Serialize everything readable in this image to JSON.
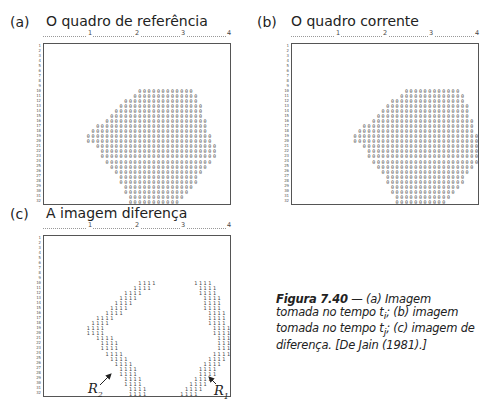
{
  "panels": [
    {
      "id": "a",
      "letter": "(a)",
      "title": "O quadro de referência",
      "ruler_ticks": [
        "1",
        "2",
        "3",
        "4"
      ],
      "row_numbers": [
        "1",
        "2",
        "3",
        "4",
        "5",
        "6",
        "7",
        "8",
        "9",
        "10",
        "11",
        "12",
        "13",
        "14",
        "15",
        "16",
        "17",
        "18",
        "19",
        "20",
        "21",
        "22",
        "23",
        "24",
        "25",
        "26",
        "27",
        "28",
        "29",
        "30",
        "31",
        "32"
      ],
      "glyph": "0",
      "rows": {
        "10": [
          20,
          31
        ],
        "11": [
          19,
          32
        ],
        "12": [
          17,
          32
        ],
        "13": [
          16,
          33
        ],
        "14": [
          15,
          33
        ],
        "15": [
          14,
          33
        ],
        "16": [
          13,
          34
        ],
        "17": [
          11,
          34
        ],
        "18": [
          10,
          34
        ],
        "19": [
          9,
          35
        ],
        "20": [
          9,
          35
        ],
        "21": [
          11,
          36
        ],
        "22": [
          12,
          36
        ],
        "23": [
          12,
          36
        ],
        "24": [
          13,
          35
        ],
        "25": [
          14,
          34
        ],
        "26": [
          15,
          33
        ],
        "27": [
          16,
          32
        ],
        "28": [
          16,
          32
        ],
        "29": [
          17,
          31
        ],
        "30": [
          17,
          30
        ],
        "31": [
          18,
          29
        ],
        "32": [
          18,
          28
        ]
      }
    },
    {
      "id": "b",
      "letter": "(b)",
      "title": "O quadro corrente",
      "ruler_ticks": [
        "1",
        "2",
        "3",
        "4"
      ],
      "row_numbers": [
        "1",
        "2",
        "3",
        "4",
        "5",
        "6",
        "7",
        "8",
        "9",
        "10",
        "11",
        "12",
        "13",
        "14",
        "15",
        "16",
        "17",
        "18",
        "19",
        "20",
        "21",
        "22",
        "23",
        "24",
        "25",
        "26",
        "27",
        "28",
        "29",
        "30",
        "31",
        "32"
      ],
      "glyph": "0",
      "rows": {
        "10": [
          24,
          35
        ],
        "11": [
          23,
          36
        ],
        "12": [
          21,
          36
        ],
        "13": [
          20,
          37
        ],
        "14": [
          19,
          37
        ],
        "15": [
          18,
          37
        ],
        "16": [
          17,
          38
        ],
        "17": [
          15,
          38
        ],
        "18": [
          14,
          38
        ],
        "19": [
          13,
          39
        ],
        "20": [
          13,
          39
        ],
        "21": [
          15,
          39
        ],
        "22": [
          16,
          39
        ],
        "23": [
          16,
          39
        ],
        "24": [
          17,
          39
        ],
        "25": [
          18,
          38
        ],
        "26": [
          19,
          37
        ],
        "27": [
          20,
          36
        ],
        "28": [
          20,
          36
        ],
        "29": [
          21,
          35
        ],
        "30": [
          21,
          34
        ],
        "31": [
          22,
          33
        ],
        "32": [
          22,
          32
        ]
      }
    },
    {
      "id": "c",
      "letter": "(c)",
      "title": "A imagem diferença",
      "ruler_ticks": [
        "1",
        "2",
        "3",
        "4"
      ],
      "row_numbers": [
        "1",
        "2",
        "3",
        "4",
        "5",
        "6",
        "7",
        "8",
        "9",
        "10",
        "11",
        "12",
        "13",
        "14",
        "15",
        "16",
        "17",
        "18",
        "19",
        "20",
        "21",
        "22",
        "23",
        "24",
        "25",
        "26",
        "27",
        "28",
        "29",
        "30",
        "31",
        "32"
      ],
      "glyph": "1",
      "region_labels": {
        "r2": {
          "base": "R",
          "sub": "2"
        },
        "r1": {
          "base": "R",
          "sub": "1"
        }
      }
    }
  ],
  "caption": {
    "label": "Figura 7.40",
    "dash": " — ",
    "text_a": "(a) Imagem tomada no tempo ",
    "ti": "t",
    "ti_sub": "i",
    "text_b": "; (b) imagem tomada no tempo ",
    "tj": "t",
    "tj_sub": "j",
    "text_c": "; (c) imagem de diferença. [De Jain (1981).]"
  }
}
